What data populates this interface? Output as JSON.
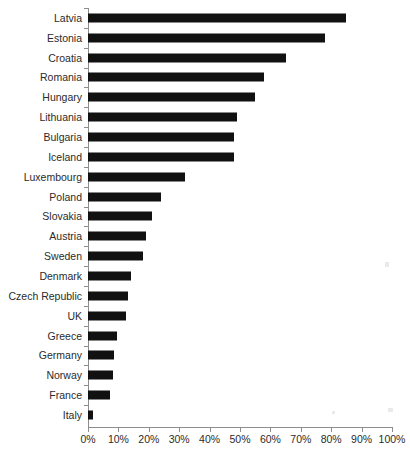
{
  "chart_data": {
    "type": "bar",
    "orientation": "horizontal",
    "title": "",
    "subtitle": "",
    "xlabel": "",
    "ylabel": "",
    "xlim": [
      0,
      100
    ],
    "grid": false,
    "legend": null,
    "value_suffix": "%",
    "xticks": [
      "0%",
      "10%",
      "20%",
      "30%",
      "40%",
      "50%",
      "60%",
      "70%",
      "80%",
      "90%",
      "100%"
    ],
    "xtick_values": [
      0,
      10,
      20,
      30,
      40,
      50,
      60,
      70,
      80,
      90,
      100
    ],
    "categories": [
      "Latvia",
      "Estonia",
      "Croatia",
      "Romania",
      "Hungary",
      "Lithuania",
      "Bulgaria",
      "Iceland",
      "Luxembourg",
      "Poland",
      "Slovakia",
      "Austria",
      "Sweden",
      "Denmark",
      "Czech Republic",
      "UK",
      "Greece",
      "Germany",
      "Norway",
      "France",
      "Italy"
    ],
    "values": [
      85,
      78,
      65,
      58,
      55,
      49,
      48,
      48,
      32,
      24,
      21,
      19,
      18,
      14,
      13,
      12.5,
      9.5,
      8.7,
      8.3,
      7.3,
      1.5
    ],
    "bar_color": "#111111",
    "axis_color": "#8d8d8d",
    "text_color": "#2b2b2b"
  }
}
